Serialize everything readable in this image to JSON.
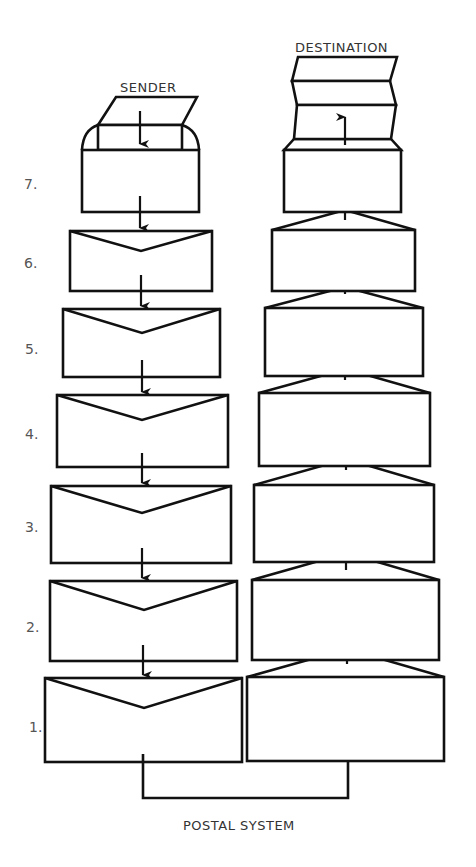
{
  "diagram": {
    "type": "layered-communication-analogy",
    "left_column_label": "SENDER",
    "right_column_label": "DESTINATION",
    "bottom_label": "POSTAL SYSTEM",
    "layers": [
      {
        "number": "7.",
        "left": "letter inserted into open envelope",
        "right": "letter unfolded from opened envelope"
      },
      {
        "number": "6.",
        "left": "envelope with closed flap",
        "right": "envelope with open flap"
      },
      {
        "number": "5.",
        "left": "envelope with closed flap",
        "right": "envelope with open flap"
      },
      {
        "number": "4.",
        "left": "envelope with closed flap",
        "right": "envelope with open flap"
      },
      {
        "number": "3.",
        "left": "envelope with closed flap",
        "right": "envelope with open flap"
      },
      {
        "number": "2.",
        "left": "envelope with closed flap",
        "right": "envelope with open flap"
      },
      {
        "number": "1.",
        "left": "envelope with closed flap",
        "right": "envelope with open flap"
      }
    ],
    "flow": "down the sender stack, across the postal system, up the destination stack",
    "colors": {
      "line": "#111111",
      "text": "#333333",
      "numbers": "#555555",
      "background": "#ffffff"
    }
  }
}
